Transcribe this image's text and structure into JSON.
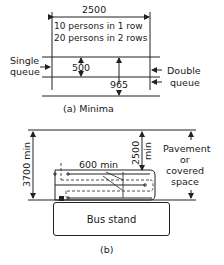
{
  "figure_a": {
    "caption": "(a) Minima",
    "width_dimension": "2500",
    "capacity_line_1": "10 persons in 1 row",
    "capacity_line_2": "20 persons in 2 rows",
    "single_queue_label_1": "Single",
    "single_queue_label_2": "queue",
    "single_queue_width": "500",
    "double_queue_width": "965",
    "double_queue_label_1": "Double",
    "double_queue_label_2": "queue"
  },
  "figure_b": {
    "caption": "(b)",
    "overall_depth": "3700 min",
    "shelter_depth_1": "2500",
    "shelter_depth_2": "min",
    "queue_spacing": "600 min",
    "pavement_label_1": "Pavement",
    "pavement_label_2": "or",
    "pavement_label_3": "covered",
    "pavement_label_4": "space",
    "bus_stand_label": "Bus stand"
  },
  "colors": {
    "line": "#222222",
    "background": "#ffffff"
  }
}
